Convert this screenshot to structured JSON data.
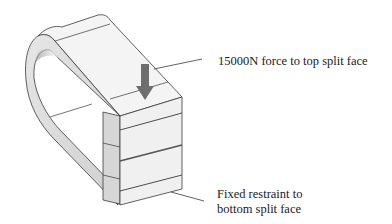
{
  "figure": {
    "annotations": [
      {
        "id": "force",
        "lines": [
          "15000N force to top split face"
        ]
      },
      {
        "id": "fixed",
        "lines": [
          "Fixed restraint to",
          "bottom split face"
        ]
      }
    ],
    "load_arrow": {
      "direction": "down",
      "color": "#6e6e6e"
    },
    "colors": {
      "face_light": "#f2f2f2",
      "face_mid": "#d8d8d8",
      "edge": "#3a3a3a",
      "shade": "#c4c4c4"
    }
  }
}
